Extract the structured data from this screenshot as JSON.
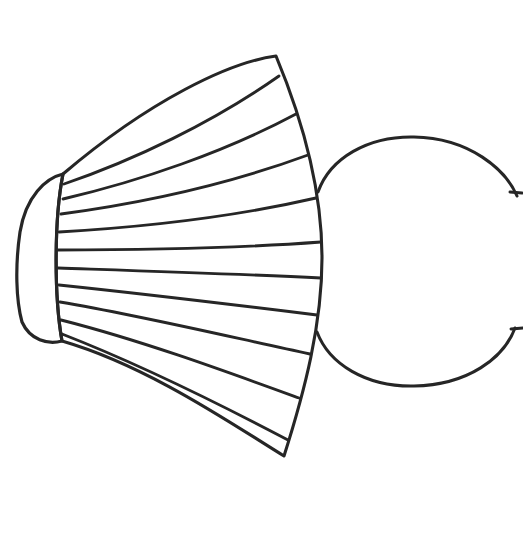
{
  "image": {
    "title": "Fan and Circle Line Drawing",
    "kind": "line-art-illustration",
    "width": 523,
    "height": 556,
    "background_color": "#ffffff",
    "stroke_color": "#262626",
    "description": "Black ink line drawing of a pleated fan / brush shape with a narrow vertical oval base at the left, ribs radiating rightward, overlapping a large open circle on the right that is clipped by the image edge."
  },
  "shapes": {
    "fan": {
      "name": "pleated-fan",
      "rib_count": 10,
      "segment_count": 11,
      "base_center_x": 42,
      "base_center_y": 258,
      "base_radius_x": 24,
      "base_radius_y": 84,
      "top_corner_x": 276,
      "top_corner_y": 56,
      "bottom_corner_x": 284,
      "bottom_corner_y": 456,
      "outline_path": "M 63 174 C 150 100 230 62 276 56 C 306 128 322 196 322 258 C 322 324 305 390 284 456 C 232 424 148 366 62 341 C 54 296 54 219 63 174 Z",
      "base_path": "M 63 174 C 46 178 26 196 20 232 C 15 266 16 300 22 322 C 30 340 48 345 62 341 C 54 296 54 219 63 174 Z",
      "ribs": [
        {
          "index": 1,
          "d": "M 64 184 C 134 160 212 123 279 76"
        },
        {
          "index": 2,
          "d": "M 63 199 C 140 181 225 152 296 114"
        },
        {
          "index": 3,
          "d": "M 61 214 C 143 203 232 183 308 155"
        },
        {
          "index": 4,
          "d": "M 59 232 C 145 227 238 216 316 198"
        },
        {
          "index": 5,
          "d": "M 58 250 C 146 250 240 248 321 242"
        },
        {
          "index": 6,
          "d": "M 58 268 C 146 271 240 274 321 278"
        },
        {
          "index": 7,
          "d": "M 59 285 C 145 294 236 305 317 315"
        },
        {
          "index": 8,
          "d": "M 60 302 C 143 316 230 337 310 354"
        },
        {
          "index": 9,
          "d": "M 61 320 C 140 340 222 370 299 398"
        },
        {
          "index": 10,
          "d": "M 62 334 C 134 362 212 400 288 440"
        }
      ]
    },
    "circle": {
      "name": "open-circle",
      "center_x": 416,
      "center_y": 262,
      "radius": 124,
      "clipped_right": true,
      "arc_top_path": "M 318 192 C 330 158 368 136 414 137 C 470 138 506 170 517 196",
      "arc_bottom_path": "M 515 328 C 504 358 468 385 414 386 C 366 387 329 364 317 332",
      "gap_top_y": 196,
      "gap_bottom_y": 328,
      "ticks": [
        {
          "name": "tick-upper",
          "d": "M 510 192 L 522 193"
        },
        {
          "name": "tick-lower",
          "d": "M 511 329 L 523 328"
        }
      ]
    }
  },
  "labels": {
    "none_visible": ""
  }
}
